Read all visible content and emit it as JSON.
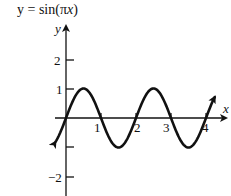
{
  "chart_data": {
    "type": "line",
    "title": "y = sin(πx)",
    "xlabel": "x",
    "ylabel": "y",
    "function": "sin(pi*x)",
    "xlim": [
      -0.4,
      4.4
    ],
    "ylim": [
      -2.3,
      3
    ],
    "x_ticks": [
      1,
      2,
      3,
      4
    ],
    "x_tick_labels": [
      "1",
      "2",
      "3",
      "4"
    ],
    "y_ticks": [
      -2,
      -1,
      1,
      2
    ],
    "y_tick_labels": [
      "−2",
      "",
      "1",
      "2"
    ],
    "grid": false,
    "legend": null,
    "series": [
      {
        "name": "y = sin(πx)",
        "x": [
          -0.3,
          0,
          0.5,
          1,
          1.5,
          2,
          2.5,
          3,
          3.5,
          4,
          4.25
        ],
        "y": [
          -0.81,
          0,
          1,
          0,
          -1,
          0,
          1,
          0,
          -1,
          0,
          0.71
        ]
      }
    ],
    "annotations": [
      "arrowheads at both curve ends",
      "axis arrows on +x and +y"
    ]
  },
  "labels": {
    "title_prefix": "y = sin(",
    "title_pi": "π",
    "title_x": "x",
    "title_suffix": ")",
    "x_axis": "x",
    "y_axis": "y",
    "tick_1": "1",
    "tick_2": "2",
    "tick_3": "3",
    "tick_4": "4",
    "ytick_1": "1",
    "ytick_2": "2",
    "ytick_m2": "−2"
  }
}
